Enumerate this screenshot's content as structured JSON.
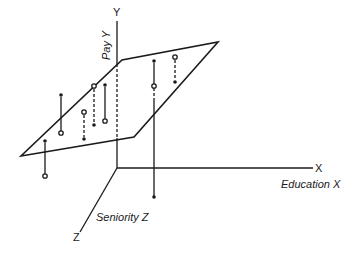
{
  "figure": {
    "type": "3d-regression-plane-diagram",
    "axes": {
      "y": {
        "letter": "Y",
        "name": "Pay Y"
      },
      "x": {
        "letter": "X",
        "name": "Education X"
      },
      "z": {
        "letter": "Z",
        "name": "Seniority Z"
      }
    },
    "colors": {
      "ink": "#1a1a1a",
      "background": "#ffffff"
    },
    "plane": {
      "vertices": [
        [
          21,
          156
        ],
        [
          134,
          137
        ],
        [
          218,
          42
        ],
        [
          122,
          60
        ]
      ]
    },
    "points": [
      {
        "x": 45,
        "observed_y": 176,
        "fitted_y": 141,
        "side": "below",
        "style": "solid"
      },
      {
        "x": 61,
        "observed_y": 133,
        "fitted_y": 95,
        "side": "below",
        "style": "solid"
      },
      {
        "x": 84,
        "observed_y": 112,
        "fitted_y": 139,
        "side": "above",
        "style": "dashed"
      },
      {
        "x": 94,
        "observed_y": 86,
        "fitted_y": 125,
        "side": "above",
        "style": "dashed"
      },
      {
        "x": 105,
        "observed_y": 121,
        "fitted_y": 85,
        "side": "below",
        "style": "solid"
      },
      {
        "x": 154,
        "observed_y": 86,
        "fitted_y": 61,
        "side": "below",
        "style": "solid"
      },
      {
        "x": 175,
        "observed_y": 57,
        "fitted_y": 82,
        "side": "above",
        "style": "dashed"
      }
    ]
  }
}
